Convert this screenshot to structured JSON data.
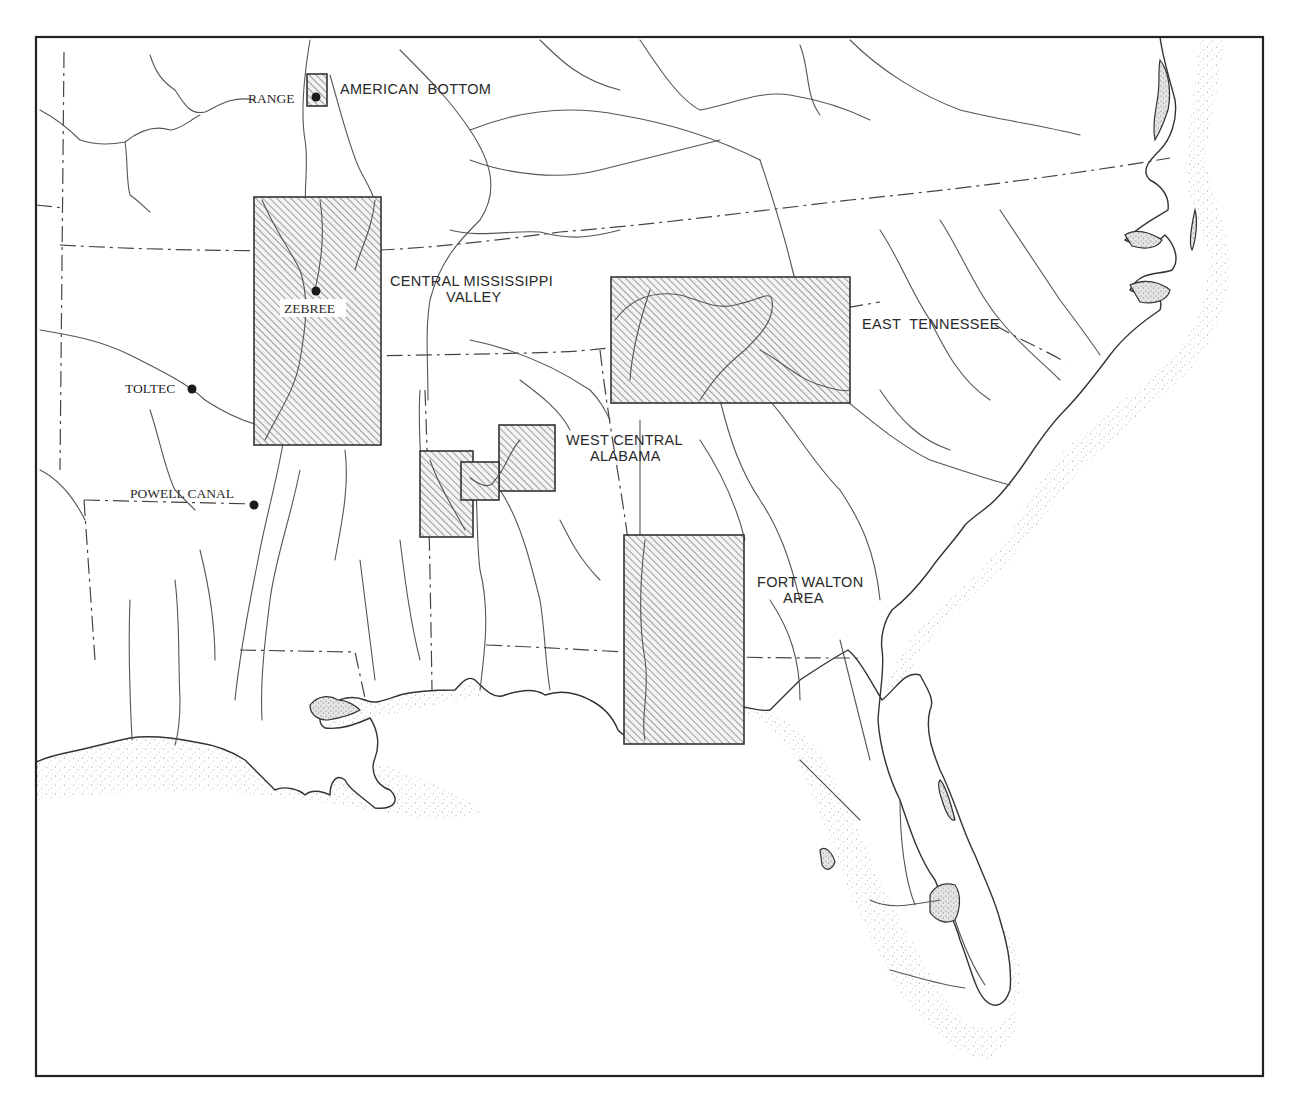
{
  "map": {
    "title": "",
    "frame": {
      "x": 36,
      "y": 37,
      "width": 1227,
      "height": 1039
    },
    "colors": {
      "ink": "#2a2a2a",
      "river": "#555555",
      "hatch": "#444444",
      "stipple": "#888888",
      "background": "#ffffff"
    },
    "study_areas": [
      {
        "id": "american-bottom",
        "label_lines": [
          "AMERICAN  BOTTOM"
        ],
        "rect": [
          307,
          74,
          20,
          32
        ]
      },
      {
        "id": "central-mississippi-valley",
        "label_lines": [
          "CENTRAL MISSISSIPPI",
          "VALLEY"
        ],
        "rect": [
          254,
          197,
          127,
          248
        ]
      },
      {
        "id": "east-tennessee",
        "label_lines": [
          "EAST  TENNESSEE"
        ],
        "rect": [
          611,
          277,
          239,
          126
        ]
      },
      {
        "id": "west-central-alabama",
        "label_lines": [
          "WEST CENTRAL",
          "ALABAMA"
        ],
        "rects": [
          [
            420,
            451,
            53,
            86
          ],
          [
            461,
            462,
            38,
            38
          ],
          [
            499,
            425,
            56,
            66
          ]
        ]
      },
      {
        "id": "fort-walton-area",
        "label_lines": [
          "FORT WALTON",
          "AREA"
        ],
        "rect": [
          624,
          535,
          120,
          209
        ]
      }
    ],
    "sites": [
      {
        "id": "range",
        "label": "RANGE",
        "x": 316,
        "y": 97
      },
      {
        "id": "zebree",
        "label": "ZEBREE",
        "x": 316,
        "y": 291
      },
      {
        "id": "toltec",
        "label": "TOLTEC",
        "x": 192,
        "y": 389
      },
      {
        "id": "powell-canal",
        "label": "POWELL CANAL",
        "x": 254,
        "y": 505
      }
    ],
    "labels": {
      "american_bottom": "AMERICAN  BOTTOM",
      "range": "RANGE",
      "zebree": "ZEBREE",
      "central_mississippi_1": "CENTRAL MISSISSIPPI",
      "central_mississippi_2": "VALLEY",
      "east_tennessee": "EAST  TENNESSEE",
      "toltec": "TOLTEC",
      "west_central_1": "WEST CENTRAL",
      "west_central_2": "ALABAMA",
      "powell_canal": "POWELL CANAL",
      "fort_walton_1": "FORT WALTON",
      "fort_walton_2": "AREA"
    },
    "legend": {
      "hatched_rectangle": "study area",
      "dot": "site",
      "dash_dot_line": "state boundary",
      "thin_line": "river",
      "stipple": "coastal water"
    }
  }
}
